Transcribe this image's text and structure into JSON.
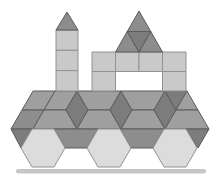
{
  "figure": {
    "background": "#ffffff",
    "canvas": {
      "width": 216,
      "height": 176
    },
    "palette": {
      "lightest": "#dcdcdc",
      "light": "#c9c9c9",
      "medium": "#9f9f9f",
      "middark": "#8d8d8d",
      "dark": "#7c7c7c",
      "stroke_soft": "#929292",
      "stroke_hard": "#5c5c5c",
      "ground": "#c6c6c6"
    },
    "shapes": [
      {
        "name": "body-left-top-rhombus",
        "fill": "medium",
        "stroke": "hard",
        "points": "33,91 55,91 44,110 22,110"
      },
      {
        "name": "body-top-rhombus-2",
        "fill": "medium",
        "stroke": "hard",
        "points": "55,91 77,91 66,110 44,110"
      },
      {
        "name": "body-left-bottom-rhombus",
        "fill": "middark",
        "stroke": "hard",
        "points": "22,110 44,110 33,129 11,129"
      },
      {
        "name": "body-left-bottom-trapezoid",
        "fill": "medium",
        "stroke": "hard",
        "points": "44,110 66,110 77,129 33,129"
      },
      {
        "name": "body-diamond-1",
        "fill": "dark",
        "stroke": "hard",
        "points": "77,91 88,110 77,129 66,110"
      },
      {
        "name": "body-top-trapezoid-1",
        "fill": "medium",
        "stroke": "hard",
        "points": "77,91 121,91 110,110 88,110"
      },
      {
        "name": "body-bottom-trapezoid-1",
        "fill": "medium",
        "stroke": "hard",
        "points": "88,110 110,110 121,129 77,129"
      },
      {
        "name": "body-diamond-2",
        "fill": "dark",
        "stroke": "hard",
        "points": "121,91 132,110 121,129 110,110"
      },
      {
        "name": "body-top-trapezoid-2",
        "fill": "medium",
        "stroke": "hard",
        "points": "121,91 165,91 154,110 132,110"
      },
      {
        "name": "body-bottom-trapezoid-2",
        "fill": "medium",
        "stroke": "hard",
        "points": "132,110 154,110 165,129 121,129"
      },
      {
        "name": "body-diamond-3",
        "fill": "dark",
        "stroke": "hard",
        "points": "165,91 176,110 165,129 154,110"
      },
      {
        "name": "body-right-down-triangle",
        "fill": "dark",
        "stroke": "hard",
        "points": "165,91 187,91 176,110"
      },
      {
        "name": "body-right-up-triangle",
        "fill": "medium",
        "stroke": "hard",
        "points": "176,110 187,91 198,110"
      },
      {
        "name": "body-right-bottom-trapezoid",
        "fill": "medium",
        "stroke": "hard",
        "points": "176,110 198,110 209,129 165,129"
      },
      {
        "name": "axle-left-triangle",
        "fill": "dark",
        "stroke": "hard",
        "points": "11,129 32,129 21,148"
      },
      {
        "name": "axle-trapezoid-1",
        "fill": "middark",
        "stroke": "hard",
        "points": "54,129 98,129 87,148 65,148"
      },
      {
        "name": "axle-trapezoid-2",
        "fill": "middark",
        "stroke": "hard",
        "points": "120,129 164,129 153,148 131,148"
      },
      {
        "name": "axle-right-triangle",
        "fill": "dark",
        "stroke": "hard",
        "points": "186,129 209,129 198,148"
      },
      {
        "name": "wheel-hexagon-1",
        "fill": "lightest",
        "stroke": "soft",
        "points": "32,129 54,129 65,148 54,167 32,167 21,148"
      },
      {
        "name": "wheel-hexagon-2",
        "fill": "lightest",
        "stroke": "soft",
        "points": "98,129 120,129 131,148 120,167 98,167 87,148"
      },
      {
        "name": "wheel-hexagon-3",
        "fill": "lightest",
        "stroke": "soft",
        "points": "164,129 186,129 197,148 186,167 164,167 153,148"
      },
      {
        "name": "tower-square-1",
        "fill": "light",
        "stroke": "soft",
        "points": "56,30 78,30 78,50.3 56,50.3"
      },
      {
        "name": "tower-square-2",
        "fill": "light",
        "stroke": "soft",
        "points": "56,50.3 78,50.3 78,70.6 56,70.6"
      },
      {
        "name": "tower-square-3",
        "fill": "light",
        "stroke": "soft",
        "points": "56,70.6 78,70.6 78,91 56,91"
      },
      {
        "name": "tower-roof-triangle",
        "fill": "middark",
        "stroke": "hard",
        "points": "67,12 56,30 78,30"
      },
      {
        "name": "cab-square-top-1",
        "fill": "light",
        "stroke": "soft",
        "points": "92,52 115.5,52 115.5,71.5 92,71.5"
      },
      {
        "name": "cab-square-top-2",
        "fill": "light",
        "stroke": "soft",
        "points": "115.5,52 139,52 139,71.5 115.5,71.5"
      },
      {
        "name": "cab-square-top-3",
        "fill": "light",
        "stroke": "soft",
        "points": "139,52 162.5,52 162.5,71.5 139,71.5"
      },
      {
        "name": "cab-square-top-4",
        "fill": "light",
        "stroke": "soft",
        "points": "162.5,52 186,52 186,71.5 162.5,71.5"
      },
      {
        "name": "cab-square-left",
        "fill": "light",
        "stroke": "soft",
        "points": "92,71.5 115.5,71.5 115.5,91 92,91"
      },
      {
        "name": "cab-square-right",
        "fill": "light",
        "stroke": "soft",
        "points": "162.5,71.5 186,71.5 186,91 162.5,91"
      },
      {
        "name": "cab-roof-triangle-left",
        "fill": "middark",
        "stroke": "hard",
        "points": "115.5,52 139,52 127.25,31.5"
      },
      {
        "name": "cab-roof-triangle-top",
        "fill": "middark",
        "stroke": "hard",
        "points": "127.25,31.5 150.75,31.5 139,11"
      },
      {
        "name": "cab-roof-triangle-right",
        "fill": "middark",
        "stroke": "hard",
        "points": "139,52 162.5,52 150.75,31.5"
      },
      {
        "name": "cab-roof-triangle-center",
        "fill": "dark",
        "stroke": "hard",
        "points": "127.25,31.5 150.75,31.5 139,52"
      }
    ],
    "ground_line": {
      "x": 16,
      "y": 169,
      "width": 190,
      "height": 4.5,
      "radius": 2.2,
      "fill_key": "ground"
    }
  }
}
